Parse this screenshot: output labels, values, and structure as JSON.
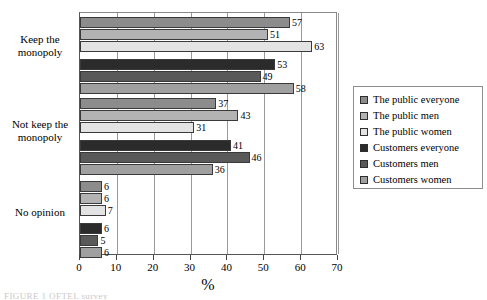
{
  "chart_data": {
    "type": "bar",
    "orientation": "horizontal",
    "title": "",
    "xlabel": "%",
    "ylabel": "",
    "xlim": [
      0,
      70
    ],
    "xticks": [
      0,
      10,
      20,
      30,
      40,
      50,
      60,
      70
    ],
    "grid": true,
    "grid_axis": "x",
    "legend_position": "right",
    "categories": [
      "Keep the monopoly",
      "Not keep the monopoly",
      "No opinion"
    ],
    "series": [
      {
        "name": "The public everyone",
        "color": "#8c8c8c",
        "values": [
          57,
          37,
          6
        ]
      },
      {
        "name": "The public men",
        "color": "#b3b3b3",
        "values": [
          51,
          43,
          6
        ]
      },
      {
        "name": "The public women",
        "color": "#e3e3e3",
        "values": [
          63,
          31,
          7
        ]
      },
      {
        "name": "Customers everyone",
        "color": "#2b2b2b",
        "values": [
          53,
          41,
          6
        ]
      },
      {
        "name": "Customers men",
        "color": "#595959",
        "values": [
          49,
          46,
          5
        ]
      },
      {
        "name": "Customers women",
        "color": "#a0a0a0",
        "values": [
          58,
          36,
          6
        ]
      }
    ]
  },
  "axis": {
    "x_title": "%",
    "tick_labels": [
      "0",
      "10",
      "20",
      "30",
      "40",
      "50",
      "60",
      "70"
    ]
  },
  "category_labels": [
    {
      "line1": "Keep the",
      "line2": "monopoly"
    },
    {
      "line1": "Not keep the",
      "line2": "monopoly"
    },
    {
      "line1": "No opinion",
      "line2": ""
    }
  ],
  "legend": {
    "items": [
      {
        "label": "The public everyone",
        "color": "#8c8c8c"
      },
      {
        "label": "The public men",
        "color": "#b3b3b3"
      },
      {
        "label": "The public women",
        "color": "#e3e3e3"
      },
      {
        "label": "Customers everyone",
        "color": "#2b2b2b"
      },
      {
        "label": "Customers men",
        "color": "#595959"
      },
      {
        "label": "Customers women",
        "color": "#a0a0a0"
      }
    ]
  },
  "caption": {
    "text": "FIGURE 1    OFTEL survey"
  }
}
